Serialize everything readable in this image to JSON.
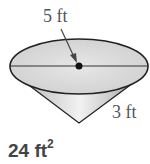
{
  "figure": {
    "type": "cone",
    "diameter_label": "5 ft",
    "height_label": "3 ft",
    "colors": {
      "fill": "#d9d9d9",
      "cone_fill": "#c8c8c8",
      "stroke": "#222222",
      "label": "#555555"
    }
  },
  "answer": {
    "value": "24 ft",
    "exponent": "2"
  }
}
